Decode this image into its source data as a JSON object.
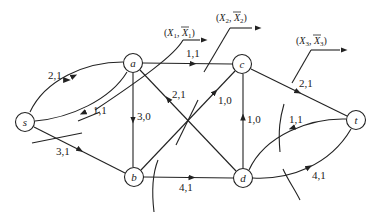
{
  "diagram": {
    "type": "flow-network-cuts",
    "nodes": [
      {
        "id": "s",
        "label": "s",
        "x": 25,
        "y": 122
      },
      {
        "id": "a",
        "label": "a",
        "x": 133,
        "y": 63
      },
      {
        "id": "b",
        "label": "b",
        "x": 134,
        "y": 177
      },
      {
        "id": "c",
        "label": "c",
        "x": 242,
        "y": 64
      },
      {
        "id": "d",
        "label": "d",
        "x": 243,
        "y": 178
      },
      {
        "id": "t",
        "label": "t",
        "x": 356,
        "y": 120
      }
    ],
    "edges": [
      {
        "from": "s",
        "to": "a",
        "label": "2,1"
      },
      {
        "from": "a",
        "to": "s",
        "label": "1,1"
      },
      {
        "from": "s",
        "to": "b",
        "label": "3,1"
      },
      {
        "from": "a",
        "to": "b",
        "label": "3,0"
      },
      {
        "from": "a",
        "to": "c",
        "label": "1,1"
      },
      {
        "from": "d",
        "to": "a",
        "label": "2,1"
      },
      {
        "from": "b",
        "to": "c",
        "label": "1,0"
      },
      {
        "from": "b",
        "to": "d",
        "label": "4,1"
      },
      {
        "from": "d",
        "to": "c",
        "label": "1,0"
      },
      {
        "from": "c",
        "to": "t",
        "label": "2,1"
      },
      {
        "from": "t",
        "to": "d",
        "label": "1,1"
      },
      {
        "from": "d",
        "to": "t",
        "label": "4,1"
      }
    ],
    "cuts": [
      {
        "id": "cut1",
        "label_x": "X",
        "sub": "1",
        "label": "(X1, X̄1)"
      },
      {
        "id": "cut2",
        "label_x": "X",
        "sub": "2",
        "label": "(X2, X̄2)"
      },
      {
        "id": "cut3",
        "label_x": "X",
        "sub": "3",
        "label": "(X3, X̄3)"
      }
    ]
  }
}
